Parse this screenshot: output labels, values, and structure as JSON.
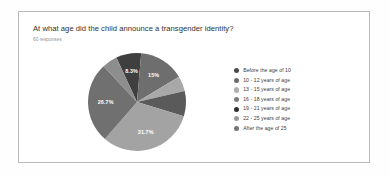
{
  "card": {
    "question_title": "At what age did the child announce a transgender identity?",
    "response_count_label": "60 responses"
  },
  "chart_data": {
    "type": "pie",
    "title": "At what age did the child announce a transgender identity?",
    "subtitle": "60 responses",
    "total_responses": 60,
    "legend_position": "right",
    "grid": false,
    "categories": [
      "Before the age of 10",
      "10 - 12 years of age",
      "13 - 15 years of age",
      "16 - 18 years of age",
      "19 - 21 years of age",
      "22 - 25 years of age",
      "After the age of 25"
    ],
    "values": [
      8.3,
      15,
      5,
      8.3,
      31.7,
      26.7,
      5
    ],
    "value_unit": "%",
    "slices": [
      {
        "label": "Before the age of 10",
        "percent": 8.3,
        "display": "8.3%",
        "show_label": true,
        "color": "#3f3f3f"
      },
      {
        "label": "10 - 12 years of age",
        "percent": 15,
        "display": "15%",
        "show_label": true,
        "color": "#6e6e6e"
      },
      {
        "label": "13 - 15 years of age",
        "percent": 5,
        "display": "5%",
        "show_label": false,
        "color": "#a8a8a8"
      },
      {
        "label": "16 - 18 years of age",
        "percent": 8.3,
        "display": "8.3%",
        "show_label": false,
        "color": "#5a5a5a"
      },
      {
        "label": "19 - 21 years of age",
        "percent": 31.7,
        "display": "31.7%",
        "show_label": true,
        "color": "#a3a3a3"
      },
      {
        "label": "22 - 25 years of age",
        "percent": 26.7,
        "display": "26.7%",
        "show_label": true,
        "color": "#707070"
      },
      {
        "label": "After the age of 25",
        "percent": 5,
        "display": "5%",
        "show_label": false,
        "color": "#8d8d8d"
      }
    ]
  },
  "legend": {
    "items": [
      {
        "label": "Before the age of 10",
        "color": "#4a4a4a"
      },
      {
        "label": "10 - 12 years of age",
        "color": "#6b6b6b"
      },
      {
        "label": "13 - 15 years of age",
        "color": "#b0b0b0"
      },
      {
        "label": "16 - 18 years of age",
        "color": "#7d7d7d"
      },
      {
        "label": "19 - 21 years of age",
        "color": "#2f2f2f"
      },
      {
        "label": "22 - 25 years of age",
        "color": "#9a9a9a"
      },
      {
        "label": "After the age of 25",
        "color": "#747474"
      }
    ]
  }
}
